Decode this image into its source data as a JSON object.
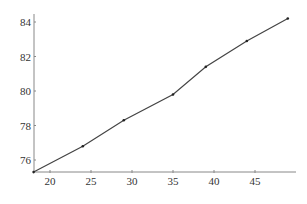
{
  "chart_data": {
    "type": "line",
    "title": "",
    "xlabel": "",
    "ylabel": "",
    "x": [
      18,
      24,
      29,
      35,
      39,
      44,
      49
    ],
    "series": [
      {
        "name": "",
        "values": [
          75.3,
          76.8,
          78.3,
          79.8,
          81.4,
          82.9,
          84.2
        ],
        "color": "#444444"
      }
    ],
    "xticks": [
      20,
      25,
      30,
      35,
      40,
      45
    ],
    "yticks": [
      76,
      78,
      80,
      82,
      84
    ],
    "xlim": [
      18,
      50
    ],
    "ylim": [
      75.3,
      84.4
    ],
    "grid": false,
    "legend": null
  },
  "colors": {
    "line": "#444444",
    "marker": "#222222",
    "axis": "#888888",
    "text": "#333333"
  }
}
